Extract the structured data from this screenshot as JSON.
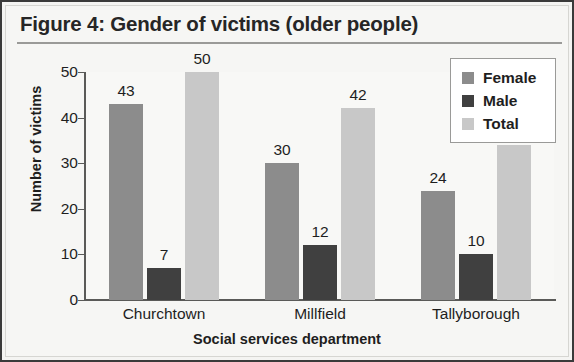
{
  "figure": {
    "title": "Figure 4: Gender of victims (older people)"
  },
  "legend": {
    "position": "top-right",
    "items": [
      {
        "label": "Female",
        "color": "#8c8c8c"
      },
      {
        "label": "Male",
        "color": "#404040"
      },
      {
        "label": "Total",
        "color": "#c8c8c8"
      }
    ]
  },
  "chart_data": {
    "type": "bar",
    "title": "Figure 4: Gender of victims (older people)",
    "xlabel": "Social services department",
    "ylabel": "Number of victims",
    "categories": [
      "Churchtown",
      "Millfield",
      "Tallyborough"
    ],
    "series": [
      {
        "name": "Female",
        "color": "#8c8c8c",
        "values": [
          43,
          30,
          24
        ]
      },
      {
        "name": "Male",
        "color": "#404040",
        "values": [
          7,
          12,
          10
        ]
      },
      {
        "name": "Total",
        "color": "#c8c8c8",
        "values": [
          50,
          42,
          34
        ]
      }
    ],
    "ylim": [
      0,
      50
    ],
    "yticks": [
      0,
      10,
      20,
      30,
      40,
      50
    ],
    "grid": false,
    "legend_position": "top-right",
    "data_labels": true
  }
}
